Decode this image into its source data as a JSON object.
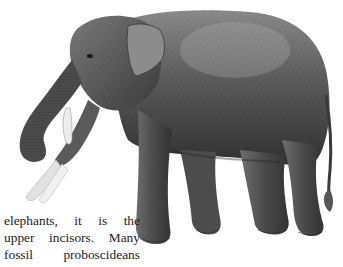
{
  "figure": {
    "style": "grayscale pencil drawing",
    "colors": {
      "body_dark": "#3a3a3a",
      "body_mid": "#6b6b6b",
      "body_light": "#9a9a9a",
      "tusk": "#e8e8e8",
      "background": "#ffffff"
    }
  },
  "text": {
    "lines": [
      "elephants, it is the",
      "upper incisors. Many",
      "fossil proboscideans"
    ],
    "color": "#222222"
  }
}
